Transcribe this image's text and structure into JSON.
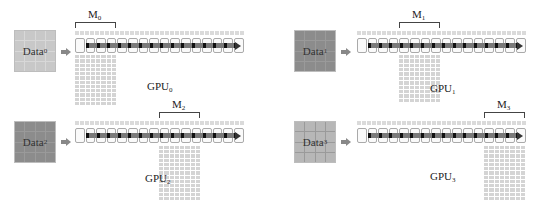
{
  "colors": {
    "data_box_dark": "#8c8c8c",
    "data_box_light": "#c8c8c8",
    "grid_cell": "#d4d4d4",
    "pipeline_bar": "#7a7a7a",
    "arrow": "#888888"
  },
  "panels": [
    {
      "id": 0,
      "data_label": "Data",
      "data_sub": "0",
      "m_label": "M",
      "m_sub": "0",
      "gpu_label": "GPU",
      "gpu_sub": "0",
      "pipeline_cells": 16,
      "highlight_segment": "first"
    },
    {
      "id": 1,
      "data_label": "Data",
      "data_sub": "1",
      "m_label": "M",
      "m_sub": "1",
      "gpu_label": "GPU",
      "gpu_sub": "1",
      "pipeline_cells": 16,
      "highlight_segment": "second"
    },
    {
      "id": 2,
      "data_label": "Data",
      "data_sub": "2",
      "m_label": "M",
      "m_sub": "2",
      "gpu_label": "GPU",
      "gpu_sub": "2",
      "pipeline_cells": 16,
      "highlight_segment": "third"
    },
    {
      "id": 3,
      "data_label": "Data",
      "data_sub": "3",
      "m_label": "M",
      "m_sub": "3",
      "gpu_label": "GPU",
      "gpu_sub": "3",
      "pipeline_cells": 16,
      "highlight_segment": "fourth"
    }
  ]
}
